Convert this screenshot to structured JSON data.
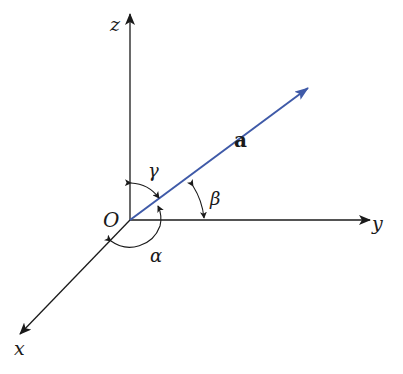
{
  "diagram": {
    "type": "3d-direction-angles",
    "colors": {
      "axis": "#1a1a1a",
      "vector": "#3f5aa8",
      "background": "#ffffff"
    },
    "origin": {
      "label": "O"
    },
    "axes": [
      {
        "id": "x",
        "label": "x"
      },
      {
        "id": "y",
        "label": "y"
      },
      {
        "id": "z",
        "label": "z"
      }
    ],
    "vector": {
      "label": "a"
    },
    "angles": [
      {
        "id": "alpha",
        "label": "α",
        "between": [
          "a",
          "x"
        ]
      },
      {
        "id": "beta",
        "label": "β",
        "between": [
          "a",
          "y"
        ]
      },
      {
        "id": "gamma",
        "label": "γ",
        "between": [
          "a",
          "z"
        ]
      }
    ]
  }
}
